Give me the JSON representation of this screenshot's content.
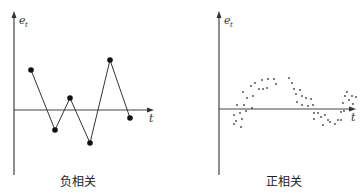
{
  "chart_data": [
    {
      "type": "line",
      "title": "负相关",
      "xlabel": "t",
      "ylabel": "e_t",
      "ylabel_main": "e",
      "ylabel_sub": "t",
      "grid": false,
      "markers": true,
      "description": "Residuals alternating sign successively (negative autocorrelation)",
      "x": [
        1,
        2,
        3,
        4,
        5,
        6
      ],
      "values": [
        1.2,
        -0.6,
        0.35,
        -1.0,
        1.5,
        -0.25
      ],
      "pixel_points": [
        [
          31,
          70
        ],
        [
          55,
          130
        ],
        [
          70,
          98
        ],
        [
          90,
          143
        ],
        [
          110,
          60
        ],
        [
          130,
          118
        ]
      ]
    },
    {
      "type": "scatter",
      "title": "正相关",
      "xlabel": "t",
      "ylabel": "e_t",
      "ylabel_main": "e",
      "ylabel_sub": "t",
      "grid": false,
      "description": "Residuals follow a wave-like pattern (positive autocorrelation)",
      "pixel_points": [
        [
          234,
          115
        ],
        [
          236,
          121
        ],
        [
          234,
          124
        ],
        [
          240,
          113
        ],
        [
          241,
          127
        ],
        [
          244,
          105
        ],
        [
          246,
          111
        ],
        [
          242,
          119
        ],
        [
          237,
          105
        ],
        [
          243,
          92
        ],
        [
          247,
          98
        ],
        [
          251,
          86
        ],
        [
          253,
          96
        ],
        [
          252,
          108
        ],
        [
          255,
          83
        ],
        [
          259,
          89
        ],
        [
          262,
          80
        ],
        [
          263,
          89
        ],
        [
          267,
          88
        ],
        [
          268,
          79
        ],
        [
          274,
          79
        ],
        [
          276,
          84
        ],
        [
          289,
          78
        ],
        [
          292,
          83
        ],
        [
          294,
          89
        ],
        [
          296,
          94
        ],
        [
          297,
          102
        ],
        [
          300,
          90
        ],
        [
          302,
          96
        ],
        [
          302,
          105
        ],
        [
          306,
          98
        ],
        [
          308,
          106
        ],
        [
          311,
          99
        ],
        [
          313,
          105
        ],
        [
          314,
          113
        ],
        [
          314,
          119
        ],
        [
          318,
          113
        ],
        [
          321,
          117
        ],
        [
          323,
          125
        ],
        [
          325,
          115
        ],
        [
          328,
          120
        ],
        [
          330,
          122
        ],
        [
          335,
          124
        ],
        [
          338,
          120
        ],
        [
          341,
          120
        ],
        [
          341,
          112
        ],
        [
          343,
          103
        ],
        [
          345,
          96
        ],
        [
          347,
          92
        ],
        [
          349,
          100
        ],
        [
          352,
          96
        ],
        [
          353,
          104
        ],
        [
          356,
          97
        ],
        [
          344,
          111
        ]
      ]
    }
  ],
  "captions": {
    "left": "负相关",
    "right": "正相关"
  },
  "axis_labels": {
    "y_main": "e",
    "y_sub": "t",
    "x": "t"
  }
}
